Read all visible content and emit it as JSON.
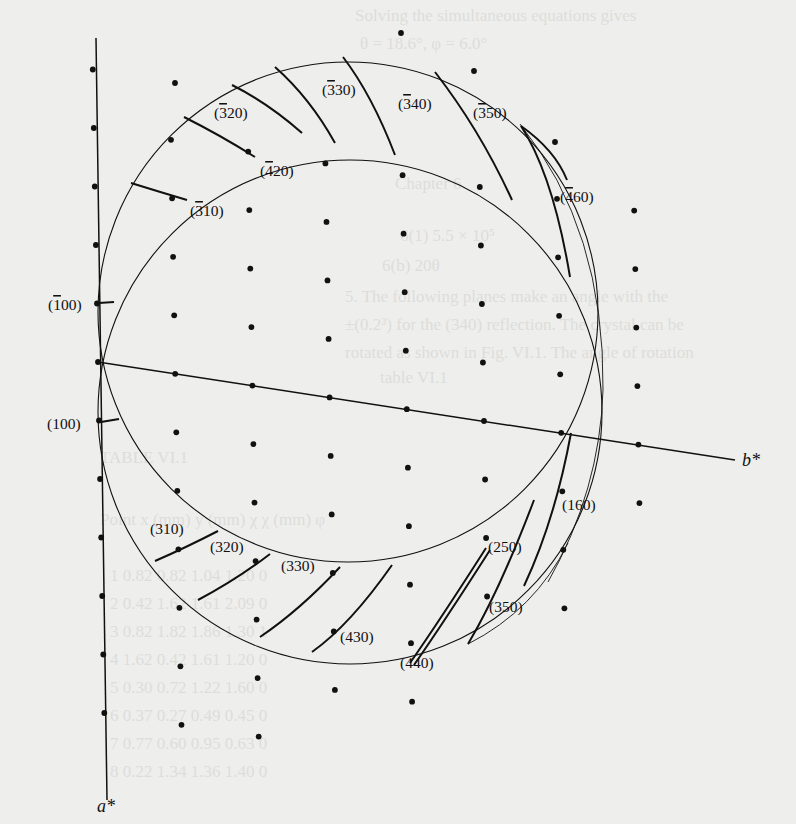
{
  "diagram": {
    "axes": [
      {
        "id": "a_star",
        "label": "a*",
        "from": [
          96,
          38
        ],
        "to": [
          107,
          800
        ],
        "label_pos": [
          97,
          812
        ]
      },
      {
        "id": "b_star",
        "label": "b*",
        "from": [
          98,
          362
        ],
        "to": [
          735,
          460
        ],
        "label_pos": [
          742,
          466
        ]
      }
    ],
    "origin": [
      98,
      362
    ],
    "lattice": {
      "a_step": [
        1.05,
        58.5
      ],
      "b_step": [
        77.2,
        11.8
      ],
      "h_range": [
        -6,
        7
      ],
      "k_range": [
        0,
        7
      ]
    },
    "circles": [
      {
        "id": "sphere-1",
        "cx": 348,
        "cy": 312,
        "r": 250
      },
      {
        "id": "sphere-2",
        "cx": 350,
        "cy": 412,
        "r": 252
      }
    ],
    "reflection_labels": [
      {
        "text": "(̅3 30)",
        "display": "(3̅ 30)",
        "hkl": "-3 3 0",
        "x": 322,
        "y": 95
      },
      {
        "text": "(3̅40)",
        "hkl": "-3 4 0",
        "x": 398,
        "y": 109
      },
      {
        "text": "(3̅50)",
        "hkl": "-3 5 0",
        "x": 473,
        "y": 118
      },
      {
        "text": "(3̅20)",
        "hkl": "-3 2 0",
        "x": 214,
        "y": 118
      },
      {
        "text": "(4̅20)",
        "hkl": "-4 2 0",
        "x": 260,
        "y": 176
      },
      {
        "text": "(4̅60)",
        "hkl": "-4 6 0",
        "x": 560,
        "y": 202
      },
      {
        "text": "(3̅10)",
        "hkl": "-3 1 0",
        "x": 190,
        "y": 216
      },
      {
        "text": "(1̅00)",
        "hkl": "-1 0 0",
        "x": 48,
        "y": 310
      },
      {
        "text": "(100)",
        "hkl": "1 0 0",
        "x": 47,
        "y": 429
      },
      {
        "text": "(160)",
        "hkl": "1 6 0",
        "x": 562,
        "y": 510
      },
      {
        "text": "(310)",
        "hkl": "3 1 0",
        "x": 150,
        "y": 534
      },
      {
        "text": "(250)",
        "hkl": "2 5 0",
        "x": 488,
        "y": 552
      },
      {
        "text": "(320)",
        "hkl": "3 2 0",
        "x": 210,
        "y": 552
      },
      {
        "text": "(330)",
        "hkl": "3 3 0",
        "x": 281,
        "y": 571
      },
      {
        "text": "(350)",
        "hkl": "3 5 0",
        "x": 489,
        "y": 612
      },
      {
        "text": "(430)",
        "hkl": "4 3 0",
        "x": 340,
        "y": 642
      },
      {
        "text": "(440)",
        "hkl": "4 4 0",
        "x": 400,
        "y": 668
      }
    ],
    "traces": [
      {
        "id": "t-310n",
        "d": "M 131 183 Q 160 192 187 200"
      },
      {
        "id": "t-420n",
        "d": "M 184 117 Q 220 135 255 157"
      },
      {
        "id": "t-520n",
        "d": "M 232 85 Q 268 103 302 133"
      },
      {
        "id": "t-530n",
        "d": "M 275 67 Q 310 98 335 143"
      },
      {
        "id": "t-540n",
        "d": "M 343 57 Q 372 95 395 155"
      },
      {
        "id": "t-550n",
        "d": "M 435 72 Q 480 130 512 200"
      },
      {
        "id": "t-460n-a",
        "d": "M 521 126 Q 553 175 570 277"
      },
      {
        "id": "t-460n-b",
        "d": "M 521 126 Q 555 150 567 180"
      },
      {
        "id": "t-100n",
        "d": "M 99 303 L 114 302"
      },
      {
        "id": "t-100",
        "d": "M 101 422 L 119 419"
      },
      {
        "id": "t-310",
        "d": "M 155 561 Q 185 548 218 531"
      },
      {
        "id": "t-320",
        "d": "M 198 600 Q 236 580 270 554"
      },
      {
        "id": "t-330",
        "d": "M 260 637 Q 300 610 340 567"
      },
      {
        "id": "t-430",
        "d": "M 312 652 Q 350 625 392 565"
      },
      {
        "id": "t-440a",
        "d": "M 410 663 Q 440 620 486 548"
      },
      {
        "id": "t-440b",
        "d": "M 414 665 Q 444 622 490 550"
      },
      {
        "id": "t-350",
        "d": "M 468 644 Q 500 590 534 500"
      },
      {
        "id": "t-160",
        "d": "M 524 586 Q 555 520 571 433"
      }
    ],
    "extra_arcs": [
      {
        "id": "arc-outer-right",
        "d": "M 520 124 Q 605 230 603 390 Q 600 490 548 582"
      },
      {
        "id": "arc-lower-right",
        "d": "M 468 644 Q 535 610 568 543"
      }
    ],
    "extra_dots": [
      [
        175,
        83
      ],
      [
        401,
        33
      ],
      [
        474,
        71
      ],
      [
        555,
        142
      ]
    ]
  },
  "background_showthrough": {
    "lines": [
      {
        "text": "Solving the simultaneous equations gives",
        "x": 355,
        "y": 20
      },
      {
        "text": "θ = 18.6°, φ = 6.0°",
        "x": 360,
        "y": 48
      },
      {
        "text": "Chapter 6",
        "x": 395,
        "y": 188
      },
      {
        "text": "6(1) 5.5 × 10⁵",
        "x": 400,
        "y": 240
      },
      {
        "text": "6(b) 20θ",
        "x": 382,
        "y": 270
      },
      {
        "text": "5. The following planes make an angle with the",
        "x": 345,
        "y": 301
      },
      {
        "text": "±(0.2³) for the (340) reflection. The crystal can be",
        "x": 345,
        "y": 329
      },
      {
        "text": "rotated as shown in Fig. VI.1. The angle of rotation",
        "x": 345,
        "y": 357
      },
      {
        "text": "table VI.1",
        "x": 380,
        "y": 382
      },
      {
        "text": "TABLE VI.1",
        "x": 100,
        "y": 462
      },
      {
        "text": "Point    x (mm)    y (mm)    χ    χ (mm)    φ",
        "x": 100,
        "y": 524
      },
      {
        "text": "1    0.82    0.82    1.04    1.20    0",
        "x": 110,
        "y": 580
      },
      {
        "text": "2    0.42    1.62    1.61    2.09    0",
        "x": 110,
        "y": 608
      },
      {
        "text": "3    0.82    1.82    1.86    1.30    1",
        "x": 110,
        "y": 636
      },
      {
        "text": "4    1.62    0.42    1.61    1.20    0",
        "x": 110,
        "y": 664
      },
      {
        "text": "5    0.30    0.72    1.22    1.60    0",
        "x": 110,
        "y": 692
      },
      {
        "text": "6    0.37    0.27    0.49    0.45    0",
        "x": 110,
        "y": 720
      },
      {
        "text": "7    0.77    0.60    0.95    0.63    0",
        "x": 110,
        "y": 748
      },
      {
        "text": "8    0.22    1.34    1.36    1.40    0",
        "x": 110,
        "y": 776
      }
    ]
  },
  "colors": {
    "paper": "#eeeeec",
    "ink": "#111111"
  }
}
